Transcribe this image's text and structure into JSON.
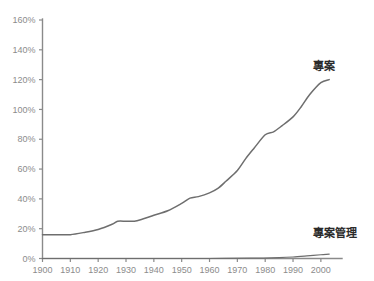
{
  "chart_data": {
    "type": "line",
    "title": "",
    "xlabel": "",
    "ylabel": "",
    "xlim": [
      1900,
      2004
    ],
    "ylim": [
      0,
      160
    ],
    "grid": false,
    "legend_position": "inline-right",
    "x_tick_labels": [
      "1900",
      "1910",
      "1920",
      "1930",
      "1940",
      "1950",
      "1960",
      "1970",
      "1980",
      "1990",
      "2000"
    ],
    "x_ticks": [
      1900,
      1910,
      1920,
      1930,
      1940,
      1950,
      1960,
      1970,
      1980,
      1990,
      2000
    ],
    "y_tick_labels": [
      "0%",
      "20%",
      "40%",
      "60%",
      "80%",
      "100%",
      "120%",
      "140%",
      "160%"
    ],
    "y_ticks": [
      0,
      20,
      40,
      60,
      80,
      100,
      120,
      140,
      160
    ],
    "series": [
      {
        "name": "專案",
        "color": "#6e6e6e",
        "label_text": "專案",
        "x": [
          1900,
          1905,
          1910,
          1915,
          1920,
          1925,
          1927,
          1930,
          1933,
          1936,
          1940,
          1945,
          1950,
          1953,
          1956,
          1960,
          1963,
          1966,
          1970,
          1973,
          1976,
          1980,
          1983,
          1986,
          1990,
          1993,
          1996,
          2000,
          2003
        ],
        "values": [
          16,
          16,
          16,
          17.5,
          19.5,
          23,
          25,
          25,
          25,
          26.5,
          29,
          32,
          37,
          40.5,
          41.5,
          44,
          47,
          52,
          59,
          67,
          74,
          83,
          85,
          89,
          95,
          102,
          110,
          118,
          120
        ]
      },
      {
        "name": "專案管理",
        "color": "#6e6e6e",
        "label_text": "專案管理",
        "x": [
          1900,
          1920,
          1940,
          1960,
          1975,
          1985,
          1990,
          1995,
          2000,
          2003
        ],
        "values": [
          0,
          0,
          0,
          0,
          0.2,
          0.6,
          1.0,
          1.7,
          2.5,
          3.0
        ]
      }
    ],
    "annotations": [
      {
        "text": "專案",
        "x_px": 313,
        "y_px": 70
      },
      {
        "text": "專案管理",
        "x_px": 313,
        "y_px": 237
      }
    ],
    "colors": {
      "background": "#ffffff",
      "axis": "#8a8a8a",
      "tick_text": "#8c8c8c",
      "series_line": "#6e6e6e",
      "annotation_text": "#2b2b2b"
    }
  }
}
